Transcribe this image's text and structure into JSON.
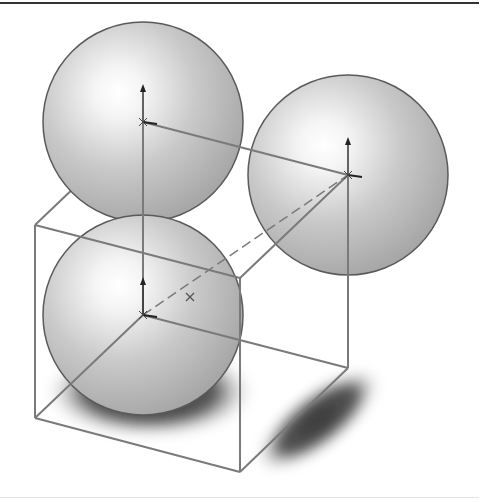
{
  "figure": {
    "background_color": "#ffffff",
    "rule_color": "#333333",
    "edge_color": "#7a7a7a",
    "sphere_outline_color": "#5a5a5a",
    "axis_color": "#333333"
  },
  "spheres": [
    {
      "name": "sphere-top-left",
      "cx": 143,
      "cy": 122,
      "r": 100,
      "hx": 118,
      "hy": 92
    },
    {
      "name": "sphere-right",
      "cx": 348,
      "cy": 175,
      "r": 100,
      "hx": 323,
      "hy": 145
    },
    {
      "name": "sphere-bottom",
      "cx": 143,
      "cy": 315,
      "r": 100,
      "hx": 118,
      "hy": 285
    }
  ],
  "cube": {
    "vertices": {
      "ftl": [
        35,
        225
      ],
      "ftr": [
        240,
        278
      ],
      "fbl": [
        35,
        418
      ],
      "fbr": [
        240,
        472
      ],
      "btl": [
        143,
        122
      ],
      "btr": [
        348,
        175
      ],
      "bbl": [
        143,
        315
      ],
      "bbr": [
        348,
        368
      ]
    },
    "dashed_edge": [
      "bbl",
      "btr"
    ]
  },
  "shadows": [
    {
      "name": "shadow-bottom-sphere",
      "cx": 150,
      "cy": 392,
      "rx": 108,
      "ry": 48
    },
    {
      "name": "shadow-right-sphere",
      "cx": 318,
      "cy": 420,
      "rx": 78,
      "ry": 30,
      "rotate": -38
    }
  ],
  "axes": [
    {
      "name": "axis-marker-top-left",
      "x": 143,
      "y": 122
    },
    {
      "name": "axis-marker-right",
      "x": 348,
      "y": 175
    },
    {
      "name": "axis-marker-bottom",
      "x": 143,
      "y": 315
    }
  ]
}
